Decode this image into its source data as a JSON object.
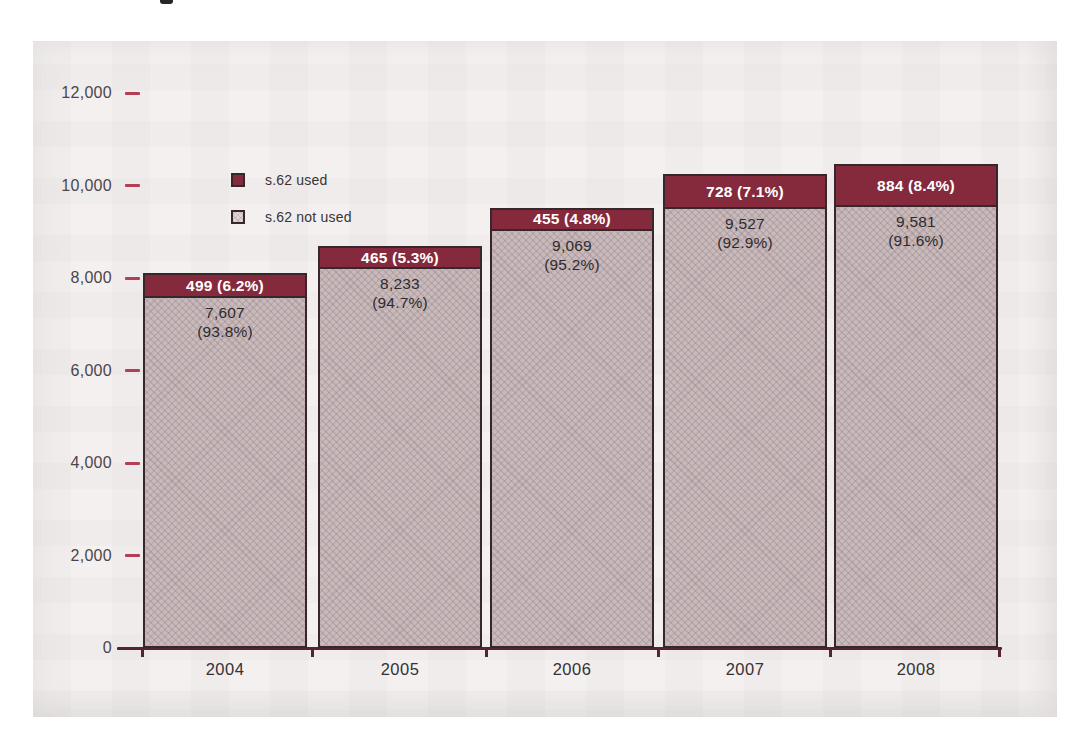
{
  "chart_data": {
    "type": "bar",
    "stacked": true,
    "title": "",
    "xlabel": "",
    "ylabel": "",
    "categories": [
      "2004",
      "2005",
      "2006",
      "2007",
      "2008"
    ],
    "series": [
      {
        "name": "s.62 used",
        "color": "#85293c",
        "values": [
          499,
          465,
          455,
          728,
          884
        ],
        "percent": [
          "6.2%",
          "5.3%",
          "4.8%",
          "7.1%",
          "8.4%"
        ],
        "labels": [
          "499 (6.2%)",
          "465 (5.3%)",
          "455 (4.8%)",
          "728 (7.1%)",
          "884 (8.4%)"
        ]
      },
      {
        "name": "s.62 not used",
        "color": "#c8b9bb",
        "values": [
          7607,
          8233,
          9069,
          9527,
          9581
        ],
        "percent": [
          "93.8%",
          "94.7%",
          "95.2%",
          "92.9%",
          "91.6%"
        ],
        "labels": [
          {
            "value_text": "7,607",
            "pct_text": "(93.8%)"
          },
          {
            "value_text": "8,233",
            "pct_text": "(94.7%)"
          },
          {
            "value_text": "9,069",
            "pct_text": "(95.2%)"
          },
          {
            "value_text": "9,527",
            "pct_text": "(92.9%)"
          },
          {
            "value_text": "9,581",
            "pct_text": "(91.6%)"
          }
        ]
      }
    ],
    "totals": [
      8106,
      8698,
      9524,
      10255,
      10465
    ],
    "ylim": [
      0,
      12000
    ],
    "y_ticks": [
      {
        "value": 12000,
        "label": "12,000"
      },
      {
        "value": 10000,
        "label": "10,000"
      },
      {
        "value": 8000,
        "label": "8,000"
      },
      {
        "value": 6000,
        "label": "6,000"
      },
      {
        "value": 4000,
        "label": "4,000"
      },
      {
        "value": 2000,
        "label": "2,000"
      },
      {
        "value": 0,
        "label": "0"
      }
    ],
    "grid": false,
    "legend_position": "top-left",
    "colors": {
      "tick_mark": "#b53d56",
      "axis_line": "#562431",
      "bar_border": "#37262b",
      "used_fill": "#85293c",
      "not_used_fill": "#c8b9bb",
      "panel_background": "#f3f0ef",
      "text": "#353135"
    }
  }
}
